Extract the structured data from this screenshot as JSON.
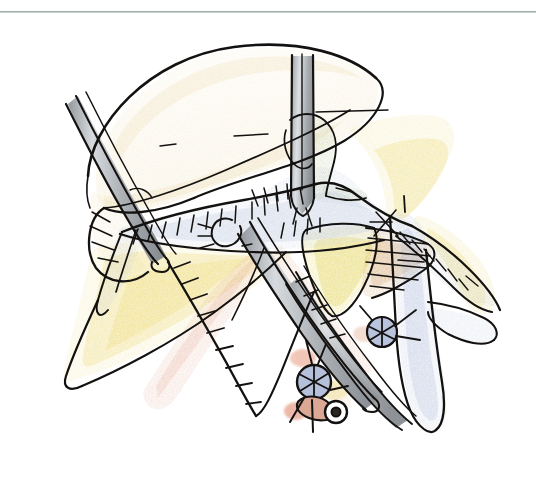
{
  "figure": {
    "kind": "hand-drawn-surgical-illustration",
    "caption": "",
    "canvas": {
      "width": 536,
      "height": 477,
      "background": "#ffffff"
    },
    "top_rule": {
      "present": true,
      "y": 11,
      "color": "#8fa398",
      "thickness": 2
    },
    "media": "ink line drawing with colored pencil wash",
    "palette": {
      "ink": "#12100e",
      "paper": "#ffffff",
      "skin_cream": "#f6ecd2",
      "fat_yellow": "#f3e9a8",
      "fat_yellow_deep": "#e4d44e",
      "tan_ochre": "#e3c487",
      "muscle_pink": "#e8b8a6",
      "muscle_tan": "#cfa06a",
      "vein_blue": "#c3cde3",
      "vein_blue_deep": "#a9b8d8",
      "nerve_green": "#b7c69a",
      "steel_light": "#d7dadd",
      "steel_mid": "#a8adb2",
      "steel_dark": "#7e848a",
      "fascia_blue_grey": "#cdd6e6"
    },
    "structures": [
      {
        "id": "skin-flap-superior",
        "label": "Superior skin/platysma flap",
        "color": "#f6ecd2",
        "interactable": false
      },
      {
        "id": "retractor-left",
        "label": "Left retractor blade",
        "color": "#a8adb2",
        "interactable": false
      },
      {
        "id": "retractor-top",
        "label": "Vertical retractor blade",
        "color": "#a8adb2",
        "interactable": false
      },
      {
        "id": "forceps-central",
        "label": "Central dissecting forceps",
        "color": "#9aa0a6",
        "interactable": false
      },
      {
        "id": "nerve-green",
        "label": "Marginal mandibular nerve",
        "color": "#b7c69a",
        "interactable": false
      },
      {
        "id": "fascia-sheet",
        "label": "Cervical fascia sheet",
        "color": "#cdd6e6",
        "interactable": false
      },
      {
        "id": "fat-pad-lateral",
        "label": "Lateral fat pad",
        "color": "#f3e9a8",
        "interactable": false
      },
      {
        "id": "fat-pad-central",
        "label": "Central fat lobule",
        "color": "#e4d44e",
        "interactable": false
      },
      {
        "id": "muscle-belly",
        "label": "Muscle belly with striations",
        "color": "#e8b8a6",
        "interactable": false
      },
      {
        "id": "muscle-striped",
        "label": "Striated muscle band",
        "color": "#cfa06a",
        "interactable": false
      },
      {
        "id": "vein-main",
        "label": "Internal jugular vein",
        "color": "#c3cde3",
        "interactable": false
      },
      {
        "id": "vein-branch",
        "label": "Venous tributary",
        "color": "#c3cde3",
        "interactable": false
      },
      {
        "id": "ligature-upper",
        "label": "Ligated vessel stump (upper)",
        "color": "#b9c3dc",
        "interactable": false
      },
      {
        "id": "ligature-lower",
        "label": "Ligated vessel stump with knot (lower)",
        "color": "#b9c3dc",
        "interactable": false
      }
    ],
    "annotation_marks": [
      {
        "id": "hatch-fascia-left",
        "label": "Cut-edge hatching, left fascia",
        "count": 12
      },
      {
        "id": "hatch-fascia-upper",
        "label": "Cut-edge hatching, upper fascia",
        "count": 10
      },
      {
        "id": "hatch-fascia-right",
        "label": "Cut-edge hatching, right fascia",
        "count": 9
      },
      {
        "id": "hatch-muscle-lower",
        "label": "Cut-edge hatching, lower muscle",
        "count": 11
      },
      {
        "id": "tick-mark-upper-right",
        "label": "Short vertical tick mark",
        "count": 1
      }
    ]
  }
}
